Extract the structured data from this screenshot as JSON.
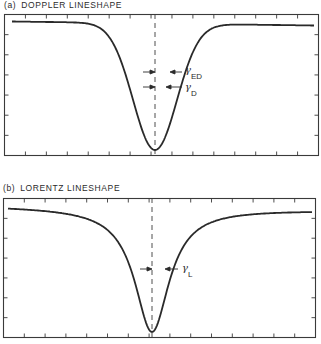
{
  "figure": {
    "panels": [
      {
        "tag": "(a)",
        "title": "DOPPLER LINESHAPE",
        "annotations": [
          {
            "symbol": "γ",
            "subscript": "ED"
          },
          {
            "symbol": "γ",
            "subscript": "D"
          }
        ]
      },
      {
        "tag": "(b)",
        "title": "LORENTZ LINESHAPE",
        "annotations": [
          {
            "symbol": "γ",
            "subscript": "L"
          }
        ]
      }
    ]
  },
  "chart_data": [
    {
      "type": "line",
      "title": "(a) DOPPLER LINESHAPE",
      "xlabel": "",
      "ylabel": "",
      "profile": "gaussian",
      "x": [
        -7,
        -6,
        -5,
        -4,
        -3,
        -2,
        -1.5,
        -1,
        -0.5,
        0,
        0.5,
        1,
        1.5,
        2,
        3,
        4,
        5,
        6,
        7
      ],
      "values": [
        1.0,
        1.0,
        1.0,
        0.99,
        0.92,
        0.62,
        0.42,
        0.22,
        0.07,
        0.0,
        0.07,
        0.22,
        0.42,
        0.62,
        0.92,
        0.99,
        1.0,
        1.0,
        1.0
      ],
      "grid": false,
      "legend": "none",
      "annotations": [
        "γED (half-width marker)",
        "γD (half-width marker)",
        "dashed line at line center"
      ],
      "ticks": {
        "x_count": 15,
        "y_count": 6,
        "tick_labels": "none"
      }
    },
    {
      "type": "line",
      "title": "(b) LORENTZ LINESHAPE",
      "xlabel": "",
      "ylabel": "",
      "profile": "lorentzian",
      "x": [
        -7,
        -6,
        -5,
        -4,
        -3,
        -2,
        -1.5,
        -1,
        -0.5,
        0,
        0.5,
        1,
        1.5,
        2,
        3,
        4,
        5,
        6,
        7
      ],
      "values": [
        0.98,
        0.97,
        0.96,
        0.94,
        0.9,
        0.8,
        0.69,
        0.5,
        0.2,
        0.0,
        0.2,
        0.5,
        0.69,
        0.8,
        0.9,
        0.94,
        0.96,
        0.97,
        0.98
      ],
      "grid": false,
      "legend": "none",
      "annotations": [
        "γL (half-width marker)",
        "dashed line at line center"
      ],
      "ticks": {
        "x_count": 15,
        "y_count": 6,
        "tick_labels": "none"
      }
    }
  ]
}
